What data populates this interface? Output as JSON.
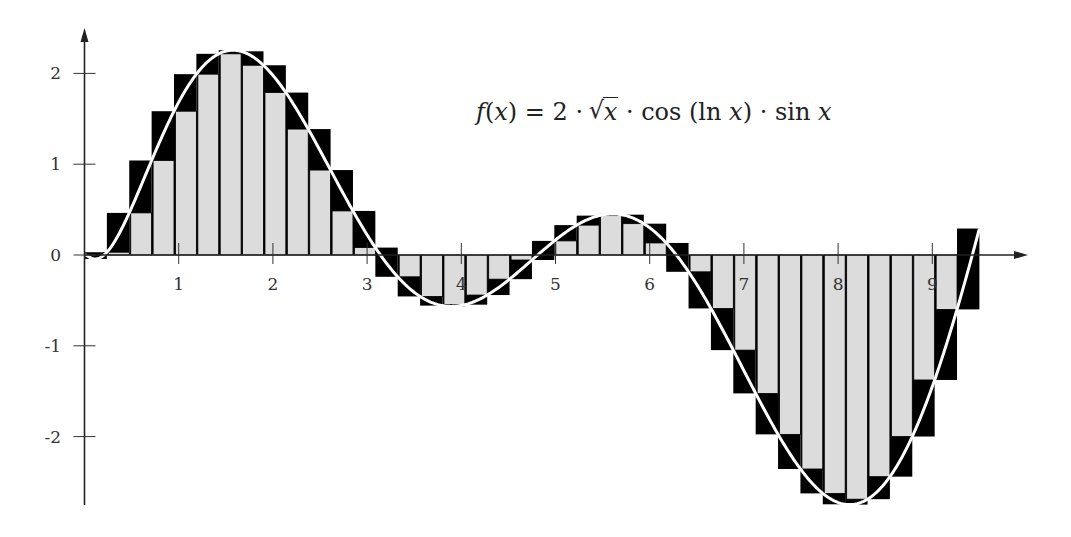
{
  "chart_data": {
    "type": "bar",
    "subtype": "riemann-upper-lower-sums",
    "title": "",
    "annotation": "f(x) = 2 · √x · cos (ln x) · sin x",
    "function": {
      "expression": "2*sqrt(x)*cos(ln(x))*sin(x)",
      "domain": [
        0,
        9.5
      ]
    },
    "intervals": 40,
    "interval_width": 0.2375,
    "x_partition": [
      0,
      0.2375,
      0.475,
      0.7125,
      0.95,
      1.1875,
      1.425,
      1.6625,
      1.9,
      2.1375,
      2.375,
      2.6125,
      2.85,
      3.0875,
      3.325,
      3.5625,
      3.8,
      4.0375,
      4.275,
      4.5125,
      4.75,
      4.9875,
      5.225,
      5.4625,
      5.7,
      5.9375,
      6.175,
      6.4125,
      6.65,
      6.8875,
      7.125,
      7.3625,
      7.6,
      7.8375,
      8.075,
      8.3125,
      8.55,
      8.7875,
      9.025,
      9.2625,
      9.5
    ],
    "f_at_partition": [
      0,
      0.03,
      0.46,
      1.04,
      1.58,
      1.99,
      2.22,
      2.24,
      2.09,
      1.79,
      1.39,
      0.93,
      0.49,
      0.08,
      -0.24,
      -0.46,
      -0.56,
      -0.55,
      -0.44,
      -0.27,
      -0.06,
      0.16,
      0.33,
      0.43,
      0.44,
      0.35,
      0.13,
      -0.18,
      -0.6,
      -1.06,
      -1.55,
      -1.99,
      -2.36,
      -2.63,
      -2.75,
      -2.69,
      -2.43,
      -2.0,
      -1.36,
      -0.62,
      0.29
    ],
    "series": [
      {
        "name": "upper/outer sum",
        "color": "#000000"
      },
      {
        "name": "lower/inner sum",
        "color": "#dcdcdc"
      },
      {
        "name": "f(x)",
        "color": "#ffffff",
        "type": "line"
      }
    ],
    "xlabel": "",
    "ylabel": "",
    "xticks": [
      1,
      2,
      3,
      4,
      5,
      6,
      7,
      8,
      9
    ],
    "yticks": [
      -2,
      -1,
      0,
      1,
      2
    ],
    "xlim": [
      0,
      9.9
    ],
    "ylim": [
      -2.8,
      2.45
    ],
    "grid": false,
    "legend": "none"
  },
  "labels": {
    "xticks": [
      "1",
      "2",
      "3",
      "4",
      "5",
      "6",
      "7",
      "8",
      "9"
    ],
    "yticks": [
      "2",
      "1",
      "0",
      "-1",
      "-2"
    ]
  }
}
